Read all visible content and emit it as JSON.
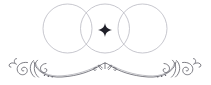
{
  "artwork": {
    "title": "Decorative Venn Circles With Flourish Divider",
    "type": "vector-ornament",
    "canvas": {
      "width": 211,
      "height": 85,
      "background_color": "#ffffff"
    },
    "colors": {
      "circle_stroke": "#b9b9c2",
      "flourish_stroke": "#5d5d66",
      "star_fill": "#1f1f28",
      "background": "#ffffff"
    },
    "circles": {
      "name": "three-overlapping-circles",
      "count": 3,
      "radius": 24.5,
      "center_y": 28.5,
      "stroke_width": 0.8,
      "centers_x": [
        67.5,
        105,
        142.5
      ],
      "labels": [
        "left-circle",
        "center-circle",
        "right-circle"
      ]
    },
    "center_star": {
      "name": "four-pointed-star",
      "center_x": 105,
      "center_y": 30,
      "radius_long": 7,
      "radius_short": 1.9
    },
    "flourish": {
      "name": "symmetric-scroll-divider",
      "baseline_y": 73,
      "peak_x": 105,
      "peak_y": 64,
      "span_x": [
        14,
        197
      ],
      "stroke_width": 0.8,
      "left_spiral_center": [
        22,
        65
      ],
      "right_spiral_center": [
        188,
        65
      ]
    }
  }
}
